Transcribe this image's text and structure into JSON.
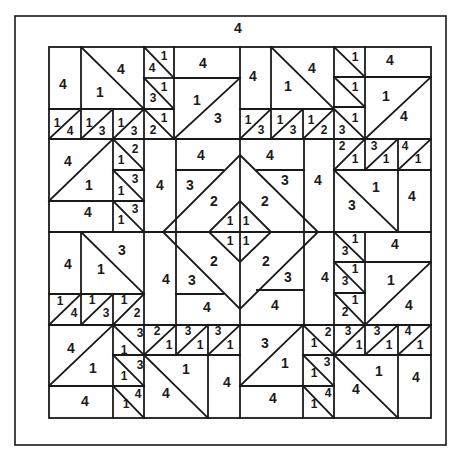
{
  "diagram": {
    "type": "quilt-pattern",
    "border_label": "4",
    "colors": {
      "line": "#1a1a1a",
      "background": "#ffffff"
    },
    "labels": [
      {
        "t": "4",
        "x": 238,
        "y": 28,
        "s": "big"
      },
      {
        "t": "4",
        "x": 63,
        "y": 84,
        "s": "big"
      },
      {
        "t": "4",
        "x": 121,
        "y": 69,
        "s": "big"
      },
      {
        "t": "1",
        "x": 100,
        "y": 92,
        "s": "big"
      },
      {
        "t": "1",
        "x": 164,
        "y": 56,
        "s": "sm"
      },
      {
        "t": "4",
        "x": 152,
        "y": 68,
        "s": "sm"
      },
      {
        "t": "1",
        "x": 164,
        "y": 87,
        "s": "sm"
      },
      {
        "t": "3",
        "x": 153,
        "y": 98,
        "s": "sm"
      },
      {
        "t": "4",
        "x": 203,
        "y": 63,
        "s": "big"
      },
      {
        "t": "1",
        "x": 197,
        "y": 100,
        "s": "big"
      },
      {
        "t": "3",
        "x": 218,
        "y": 118,
        "s": "big"
      },
      {
        "t": "4",
        "x": 253,
        "y": 76,
        "s": "big"
      },
      {
        "t": "1",
        "x": 288,
        "y": 86,
        "s": "big"
      },
      {
        "t": "4",
        "x": 312,
        "y": 68,
        "s": "big"
      },
      {
        "t": "1",
        "x": 355,
        "y": 57,
        "s": "sm"
      },
      {
        "t": "4",
        "x": 390,
        "y": 60,
        "s": "big"
      },
      {
        "t": "1",
        "x": 355,
        "y": 87,
        "s": "sm"
      },
      {
        "t": "1",
        "x": 386,
        "y": 96,
        "s": "big"
      },
      {
        "t": "4",
        "x": 404,
        "y": 116,
        "s": "big"
      },
      {
        "t": "1",
        "x": 57,
        "y": 123,
        "s": "sm"
      },
      {
        "t": "4",
        "x": 70,
        "y": 131,
        "s": "sm"
      },
      {
        "t": "1",
        "x": 89,
        "y": 123,
        "s": "sm"
      },
      {
        "t": "3",
        "x": 102,
        "y": 131,
        "s": "sm"
      },
      {
        "t": "1",
        "x": 121,
        "y": 123,
        "s": "sm"
      },
      {
        "t": "3",
        "x": 134,
        "y": 131,
        "s": "sm"
      },
      {
        "t": "1",
        "x": 164,
        "y": 118,
        "s": "sm"
      },
      {
        "t": "2",
        "x": 153,
        "y": 130,
        "s": "sm"
      },
      {
        "t": "1",
        "x": 248,
        "y": 120,
        "s": "sm"
      },
      {
        "t": "3",
        "x": 261,
        "y": 130,
        "s": "sm"
      },
      {
        "t": "1",
        "x": 280,
        "y": 120,
        "s": "sm"
      },
      {
        "t": "3",
        "x": 293,
        "y": 130,
        "s": "sm"
      },
      {
        "t": "1",
        "x": 311,
        "y": 120,
        "s": "sm"
      },
      {
        "t": "2",
        "x": 324,
        "y": 130,
        "s": "sm"
      },
      {
        "t": "3",
        "x": 342,
        "y": 130,
        "s": "sm"
      },
      {
        "t": "1",
        "x": 355,
        "y": 118,
        "s": "sm"
      },
      {
        "t": "4",
        "x": 68,
        "y": 161,
        "s": "big"
      },
      {
        "t": "1",
        "x": 89,
        "y": 185,
        "s": "big"
      },
      {
        "t": "2",
        "x": 135,
        "y": 149,
        "s": "sm"
      },
      {
        "t": "1",
        "x": 121,
        "y": 160,
        "s": "sm"
      },
      {
        "t": "3",
        "x": 135,
        "y": 179,
        "s": "sm"
      },
      {
        "t": "1",
        "x": 121,
        "y": 191,
        "s": "sm"
      },
      {
        "t": "4",
        "x": 160,
        "y": 185,
        "s": "big"
      },
      {
        "t": "4",
        "x": 88,
        "y": 212,
        "s": "big"
      },
      {
        "t": "3",
        "x": 135,
        "y": 209,
        "s": "sm"
      },
      {
        "t": "1",
        "x": 121,
        "y": 220,
        "s": "sm"
      },
      {
        "t": "4",
        "x": 201,
        "y": 155,
        "s": "big"
      },
      {
        "t": "3",
        "x": 190,
        "y": 185,
        "s": "big"
      },
      {
        "t": "2",
        "x": 214,
        "y": 201,
        "s": "big"
      },
      {
        "t": "4",
        "x": 270,
        "y": 155,
        "s": "big"
      },
      {
        "t": "3",
        "x": 285,
        "y": 180,
        "s": "big"
      },
      {
        "t": "2",
        "x": 265,
        "y": 201,
        "s": "big"
      },
      {
        "t": "4",
        "x": 318,
        "y": 180,
        "s": "big"
      },
      {
        "t": "2",
        "x": 342,
        "y": 146,
        "s": "sm"
      },
      {
        "t": "1",
        "x": 355,
        "y": 159,
        "s": "sm"
      },
      {
        "t": "3",
        "x": 374,
        "y": 146,
        "s": "sm"
      },
      {
        "t": "1",
        "x": 386,
        "y": 159,
        "s": "sm"
      },
      {
        "t": "4",
        "x": 405,
        "y": 146,
        "s": "sm"
      },
      {
        "t": "1",
        "x": 418,
        "y": 159,
        "s": "sm"
      },
      {
        "t": "1",
        "x": 376,
        "y": 187,
        "s": "big"
      },
      {
        "t": "3",
        "x": 352,
        "y": 205,
        "s": "big"
      },
      {
        "t": "4",
        "x": 412,
        "y": 196,
        "s": "big"
      },
      {
        "t": "1",
        "x": 230,
        "y": 221,
        "s": "sm"
      },
      {
        "t": "1",
        "x": 246,
        "y": 221,
        "s": "sm"
      },
      {
        "t": "1",
        "x": 230,
        "y": 241,
        "s": "sm"
      },
      {
        "t": "1",
        "x": 246,
        "y": 241,
        "s": "sm"
      },
      {
        "t": "4",
        "x": 68,
        "y": 264,
        "s": "big"
      },
      {
        "t": "3",
        "x": 122,
        "y": 250,
        "s": "big"
      },
      {
        "t": "1",
        "x": 101,
        "y": 269,
        "s": "big"
      },
      {
        "t": "4",
        "x": 166,
        "y": 279,
        "s": "big"
      },
      {
        "t": "2",
        "x": 214,
        "y": 261,
        "s": "big"
      },
      {
        "t": "3",
        "x": 192,
        "y": 280,
        "s": "big"
      },
      {
        "t": "4",
        "x": 207,
        "y": 307,
        "s": "big"
      },
      {
        "t": "2",
        "x": 266,
        "y": 261,
        "s": "big"
      },
      {
        "t": "3",
        "x": 288,
        "y": 277,
        "s": "big"
      },
      {
        "t": "4",
        "x": 275,
        "y": 305,
        "s": "big"
      },
      {
        "t": "4",
        "x": 325,
        "y": 277,
        "s": "big"
      },
      {
        "t": "1",
        "x": 355,
        "y": 239,
        "s": "sm"
      },
      {
        "t": "3",
        "x": 345,
        "y": 251,
        "s": "sm"
      },
      {
        "t": "4",
        "x": 395,
        "y": 244,
        "s": "big"
      },
      {
        "t": "1",
        "x": 355,
        "y": 269,
        "s": "sm"
      },
      {
        "t": "3",
        "x": 345,
        "y": 281,
        "s": "sm"
      },
      {
        "t": "1",
        "x": 391,
        "y": 280,
        "s": "big"
      },
      {
        "t": "1",
        "x": 355,
        "y": 300,
        "s": "sm"
      },
      {
        "t": "2",
        "x": 345,
        "y": 312,
        "s": "sm"
      },
      {
        "t": "4",
        "x": 409,
        "y": 305,
        "s": "big"
      },
      {
        "t": "1",
        "x": 60,
        "y": 301,
        "s": "sm"
      },
      {
        "t": "4",
        "x": 74,
        "y": 313,
        "s": "sm"
      },
      {
        "t": "1",
        "x": 92,
        "y": 300,
        "s": "sm"
      },
      {
        "t": "3",
        "x": 106,
        "y": 313,
        "s": "sm"
      },
      {
        "t": "1",
        "x": 124,
        "y": 300,
        "s": "sm"
      },
      {
        "t": "2",
        "x": 137,
        "y": 313,
        "s": "sm"
      },
      {
        "t": "4",
        "x": 71,
        "y": 348,
        "s": "big"
      },
      {
        "t": "1",
        "x": 93,
        "y": 368,
        "s": "big"
      },
      {
        "t": "1",
        "x": 124,
        "y": 350,
        "s": "sm"
      },
      {
        "t": "3",
        "x": 140,
        "y": 333,
        "s": "sm"
      },
      {
        "t": "2",
        "x": 157,
        "y": 331,
        "s": "sm"
      },
      {
        "t": "1",
        "x": 169,
        "y": 345,
        "s": "sm"
      },
      {
        "t": "3",
        "x": 188,
        "y": 331,
        "s": "sm"
      },
      {
        "t": "1",
        "x": 200,
        "y": 345,
        "s": "sm"
      },
      {
        "t": "3",
        "x": 218,
        "y": 331,
        "s": "sm"
      },
      {
        "t": "1",
        "x": 230,
        "y": 345,
        "s": "sm"
      },
      {
        "t": "1",
        "x": 124,
        "y": 376,
        "s": "sm"
      },
      {
        "t": "3",
        "x": 140,
        "y": 365,
        "s": "sm"
      },
      {
        "t": "1",
        "x": 186,
        "y": 369,
        "s": "big"
      },
      {
        "t": "4",
        "x": 166,
        "y": 393,
        "s": "big"
      },
      {
        "t": "4",
        "x": 227,
        "y": 382,
        "s": "big"
      },
      {
        "t": "4",
        "x": 85,
        "y": 401,
        "s": "big"
      },
      {
        "t": "1",
        "x": 126,
        "y": 404,
        "s": "sm"
      },
      {
        "t": "4",
        "x": 138,
        "y": 394,
        "s": "sm"
      },
      {
        "t": "3",
        "x": 265,
        "y": 343,
        "s": "big"
      },
      {
        "t": "1",
        "x": 285,
        "y": 363,
        "s": "big"
      },
      {
        "t": "4",
        "x": 273,
        "y": 398,
        "s": "big"
      },
      {
        "t": "1",
        "x": 314,
        "y": 343,
        "s": "sm"
      },
      {
        "t": "2",
        "x": 328,
        "y": 332,
        "s": "sm"
      },
      {
        "t": "3",
        "x": 348,
        "y": 331,
        "s": "sm"
      },
      {
        "t": "1",
        "x": 359,
        "y": 345,
        "s": "sm"
      },
      {
        "t": "3",
        "x": 377,
        "y": 331,
        "s": "sm"
      },
      {
        "t": "1",
        "x": 389,
        "y": 345,
        "s": "sm"
      },
      {
        "t": "4",
        "x": 408,
        "y": 331,
        "s": "sm"
      },
      {
        "t": "1",
        "x": 420,
        "y": 345,
        "s": "sm"
      },
      {
        "t": "3",
        "x": 327,
        "y": 362,
        "s": "sm"
      },
      {
        "t": "1",
        "x": 314,
        "y": 373,
        "s": "sm"
      },
      {
        "t": "4",
        "x": 328,
        "y": 393,
        "s": "sm"
      },
      {
        "t": "1",
        "x": 314,
        "y": 404,
        "s": "sm"
      },
      {
        "t": "1",
        "x": 379,
        "y": 371,
        "s": "big"
      },
      {
        "t": "4",
        "x": 356,
        "y": 389,
        "s": "big"
      },
      {
        "t": "4",
        "x": 416,
        "y": 377,
        "s": "big"
      }
    ]
  }
}
